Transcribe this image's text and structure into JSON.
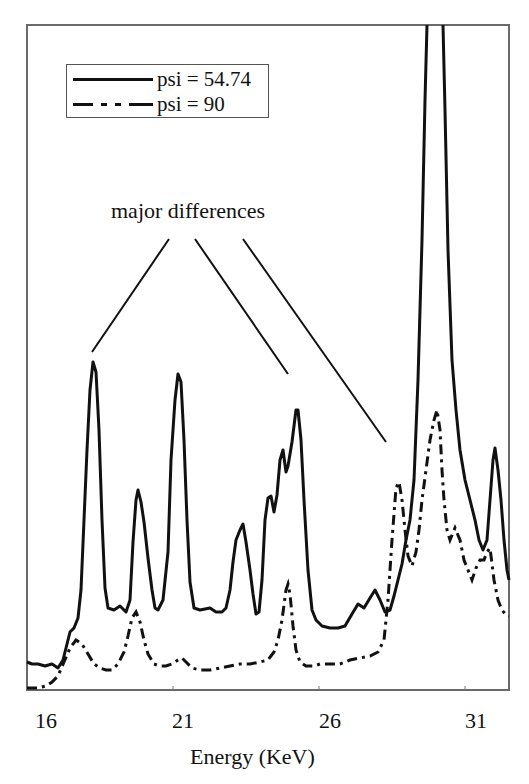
{
  "chart": {
    "title_fragment": "… g … y …",
    "annotation": "major differences",
    "xlabel": "Energy (KeV)",
    "ticks": [
      {
        "label": "16",
        "x": 28
      },
      {
        "label": "21",
        "x": 174
      },
      {
        "label": "26",
        "x": 320
      },
      {
        "label": "31",
        "x": 466
      }
    ],
    "legend": [
      {
        "label": "psi = 54.74",
        "style": "solid"
      },
      {
        "label": "psi = 90",
        "style": "dash-dot"
      }
    ]
  },
  "chart_data": {
    "type": "line",
    "title": "",
    "xlabel": "Energy (KeV)",
    "ylabel": "",
    "xlim": [
      16,
      32.3
    ],
    "ylim_note": "arbitrary intensity units; psi=54.74 main peak near 30 KeV clipped above plot top",
    "grid": false,
    "legend_position": "upper-left",
    "x_ticks": [
      16,
      21,
      26,
      31
    ],
    "annotations": [
      {
        "text": "major differences",
        "pointing_to_KeV": [
          18.2,
          25.0,
          28.4
        ]
      }
    ],
    "series": [
      {
        "name": "psi = 54.74",
        "style": "solid",
        "peaks_KeV": [
          {
            "x": 18.2,
            "rel_height": 0.49
          },
          {
            "x": 19.9,
            "rel_height": 0.3
          },
          {
            "x": 21.1,
            "rel_height": 0.5
          },
          {
            "x": 23.4,
            "rel_height": 0.24
          },
          {
            "x": 24.3,
            "rel_height": 0.32
          },
          {
            "x": 24.8,
            "rel_height": 0.38
          },
          {
            "x": 25.2,
            "rel_height": 0.42
          },
          {
            "x": 27.6,
            "rel_height": 0.14
          },
          {
            "x": 29.9,
            "rel_height": 1.0
          },
          {
            "x": 31.9,
            "rel_height": 0.38
          }
        ]
      },
      {
        "name": "psi = 90",
        "style": "dash-dot",
        "peaks_KeV": [
          {
            "x": 17.7,
            "rel_height": 0.07
          },
          {
            "x": 19.8,
            "rel_height": 0.12
          },
          {
            "x": 21.1,
            "rel_height": 0.04
          },
          {
            "x": 25.1,
            "rel_height": 0.13
          },
          {
            "x": 28.8,
            "rel_height": 0.29
          },
          {
            "x": 30.2,
            "rel_height": 0.4
          },
          {
            "x": 31.7,
            "rel_height": 0.24
          }
        ]
      }
    ]
  },
  "paths": {
    "solid": "M27,662 L32,664 L38,664 L45,666 L52,664 L58,668 L63,660 L66,648 L70,632 L74,628 L78,618 L81,590 L84,520 L87,450 L90,390 L93,362 L96,372 L99,430 L102,520 L105,588 L108,608 L114,610 L120,606 L126,612 L130,600 L133,542 L136,500 L138,490 L141,502 L144,522 L148,558 L152,590 L155,608 L158,610 L163,600 L168,552 L171,460 L175,400 L178,374 L181,382 L184,440 L187,520 L190,582 L194,608 L200,610 L210,608 L216,612 L222,612 L226,608 L230,590 L233,562 L236,540 L240,530 L243,524 L246,542 L250,570 L253,594 L256,614 L259,612 L262,580 L265,520 L268,498 L271,496 L274,512 L277,495 L280,460 L283,450 L286,472 L288,466 L292,442 L296,410 L298,410 L301,440 L304,500 L308,570 L312,610 L316,620 L322,626 L330,628 L338,628 L345,626 L352,614 L358,604 L364,608 L370,598 L375,590 L380,600 L385,612 L390,610 L394,596 L398,580 L402,564 L406,540 L410,520 L414,480 L418,380 L422,240 L425,100 L427,25 M443,25 L445,110 L448,250 L452,360 L456,410 L460,450 L465,480 L470,500 L475,520 L479,540 L483,550 L487,540 L490,500 L493,460 L495,448 L498,470 L501,500 L504,540 L507,570 L509,580",
    "dashdot": "M27,688 L38,688 L46,686 L52,682 L58,676 L64,662 L70,648 L76,640 L82,644 L88,654 L94,664 L100,668 L106,670 L112,670 L118,664 L124,652 L128,636 L132,618 L136,612 L140,622 L144,640 L148,654 L154,664 L160,666 L166,666 L172,664 L178,660 L182,658 L186,662 L192,668 L200,670 L210,670 L220,668 L230,666 L240,664 L250,664 L260,662 L268,660 L274,652 L278,640 L282,620 L286,590 L288,584 L290,594 L293,626 L296,650 L300,662 L306,666 L314,666 L320,664 L330,664 L340,664 L350,660 L360,658 L370,656 L378,652 L384,640 L388,600 L392,540 L396,488 L399,482 L402,500 L405,530 L408,556 L412,566 L416,552 L419,530 L422,500 L426,470 L430,440 L434,420 L437,410 L440,430 L442,470 L444,500 L447,530 L450,540 L455,528 L460,540 L464,560 L468,570 L472,580 L476,568 L480,560 L484,560 L487,552 L490,548 L494,580 L498,600 L502,610 L506,615 L509,616",
    "annot_lines": [
      {
        "x1": 169,
        "y1": 239,
        "x2": 92,
        "y2": 352
      },
      {
        "x1": 195,
        "y1": 239,
        "x2": 288,
        "y2": 374
      },
      {
        "x1": 243,
        "y1": 239,
        "x2": 386,
        "y2": 442
      }
    ]
  }
}
